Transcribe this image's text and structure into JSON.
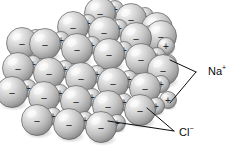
{
  "figure": {
    "background_color": "#ffffff",
    "line_color": "#0d0d0d",
    "sphere_light_color": "#f2f2f2",
    "sphere_mid_color": "#c9c9c9",
    "sphere_dark_color": "#8e8e8e",
    "sphere_outline_color": "#5e5e5e",
    "charge_glyph_color": "#242424"
  },
  "labels": [
    {
      "id": "sodium",
      "text": "Na",
      "superscript": "+",
      "name": "sodium-ion-label",
      "x": 208,
      "y": 72,
      "leaders": [
        {
          "x1": 196,
          "y1": 72,
          "x2": 170,
          "y2": 60
        },
        {
          "x1": 196,
          "y1": 72,
          "x2": 170,
          "y2": 103
        }
      ]
    },
    {
      "id": "chloride",
      "text": "Cl",
      "superscript": "−",
      "name": "chloride-ion-label",
      "x": 179,
      "y": 133,
      "leaders": [
        {
          "x1": 174,
          "y1": 131,
          "x2": 147,
          "y2": 108
        },
        {
          "x1": 174,
          "y1": 131,
          "x2": 108,
          "y2": 121
        }
      ]
    }
  ],
  "legend_meaning": {
    "plus_glyph": "+",
    "minus_glyph": "−",
    "plus_ion": "Na+",
    "minus_ion": "Cl-"
  },
  "lattice": {
    "description": "Isometric cube of alternating large anions and small cations",
    "anion_radius": 15.5,
    "cation_radius": 8.5,
    "spheres": [
      {
        "cx": 100,
        "cy": 13,
        "r": 15.5,
        "q": "−"
      },
      {
        "cx": 131,
        "cy": 19,
        "r": 15.5,
        "q": "−"
      },
      {
        "cx": 157,
        "cy": 28,
        "r": 15.5,
        "q": "−"
      },
      {
        "cx": 115,
        "cy": 9,
        "r": 8.5,
        "q": "+"
      },
      {
        "cx": 145,
        "cy": 16,
        "r": 8.5,
        "q": "+"
      },
      {
        "cx": 73,
        "cy": 27,
        "r": 15.5,
        "q": "−"
      },
      {
        "cx": 104,
        "cy": 32,
        "r": 15.5,
        "q": "−"
      },
      {
        "cx": 136,
        "cy": 38,
        "r": 15.5,
        "q": "−"
      },
      {
        "cx": 88,
        "cy": 23,
        "r": 8.5,
        "q": "+"
      },
      {
        "cx": 119,
        "cy": 28,
        "r": 8.5,
        "q": "+"
      },
      {
        "cx": 151,
        "cy": 34,
        "r": 8.5,
        "q": "+"
      },
      {
        "cx": 45,
        "cy": 44,
        "r": 15.5,
        "q": "−"
      },
      {
        "cx": 77,
        "cy": 49,
        "r": 15.5,
        "q": "−"
      },
      {
        "cx": 109,
        "cy": 54,
        "r": 15.5,
        "q": "−"
      },
      {
        "cx": 141,
        "cy": 59,
        "r": 15.5,
        "q": "−"
      },
      {
        "cx": 61,
        "cy": 40,
        "r": 8.5,
        "q": "+"
      },
      {
        "cx": 92,
        "cy": 45,
        "r": 8.5,
        "q": "+"
      },
      {
        "cx": 124,
        "cy": 50,
        "r": 8.5,
        "q": "+"
      },
      {
        "cx": 157,
        "cy": 56,
        "r": 8.5,
        "q": "+"
      },
      {
        "cx": 22,
        "cy": 43,
        "r": 15.5,
        "q": "−"
      },
      {
        "cx": 36,
        "cy": 38,
        "r": 8.5,
        "q": "+"
      },
      {
        "cx": 18,
        "cy": 68,
        "r": 15.5,
        "q": "−"
      },
      {
        "cx": 49,
        "cy": 73,
        "r": 15.5,
        "q": "−"
      },
      {
        "cx": 81,
        "cy": 78,
        "r": 15.5,
        "q": "−"
      },
      {
        "cx": 113,
        "cy": 83,
        "r": 15.5,
        "q": "−"
      },
      {
        "cx": 145,
        "cy": 88,
        "r": 15.5,
        "q": "−"
      },
      {
        "cx": 33,
        "cy": 64,
        "r": 8.5,
        "q": "+"
      },
      {
        "cx": 65,
        "cy": 69,
        "r": 8.5,
        "q": "+"
      },
      {
        "cx": 97,
        "cy": 74,
        "r": 8.5,
        "q": "+"
      },
      {
        "cx": 129,
        "cy": 79,
        "r": 8.5,
        "q": "+"
      },
      {
        "cx": 161,
        "cy": 84,
        "r": 8.5,
        "q": "+"
      },
      {
        "cx": 12,
        "cy": 92,
        "r": 15.5,
        "q": "−"
      },
      {
        "cx": 44,
        "cy": 97,
        "r": 15.5,
        "q": "−"
      },
      {
        "cx": 76,
        "cy": 101,
        "r": 15.5,
        "q": "−"
      },
      {
        "cx": 108,
        "cy": 106,
        "r": 15.5,
        "q": "−"
      },
      {
        "cx": 140,
        "cy": 110,
        "r": 15.5,
        "q": "−"
      },
      {
        "cx": 28,
        "cy": 88,
        "r": 8.5,
        "q": "+"
      },
      {
        "cx": 60,
        "cy": 93,
        "r": 8.5,
        "q": "+"
      },
      {
        "cx": 92,
        "cy": 97,
        "r": 8.5,
        "q": "+"
      },
      {
        "cx": 124,
        "cy": 102,
        "r": 8.5,
        "q": "+"
      },
      {
        "cx": 156,
        "cy": 106,
        "r": 8.5,
        "q": "+"
      },
      {
        "cx": 37,
        "cy": 120,
        "r": 15.5,
        "q": "−"
      },
      {
        "cx": 69,
        "cy": 124,
        "r": 15.5,
        "q": "−"
      },
      {
        "cx": 101,
        "cy": 127,
        "r": 15.5,
        "q": "−"
      },
      {
        "cx": 53,
        "cy": 116,
        "r": 8.5,
        "q": "+"
      },
      {
        "cx": 85,
        "cy": 120,
        "r": 8.5,
        "q": "+"
      },
      {
        "cx": 117,
        "cy": 123,
        "r": 8.5,
        "q": "+"
      },
      {
        "cx": 166,
        "cy": 46,
        "r": 8.5,
        "q": "+"
      },
      {
        "cx": 168,
        "cy": 63,
        "r": 8.5,
        "q": "+"
      },
      {
        "cx": 168,
        "cy": 100,
        "r": 8.5,
        "q": "+"
      },
      {
        "cx": 163,
        "cy": 70,
        "r": 15.5,
        "q": "−"
      },
      {
        "cx": 161,
        "cy": 36,
        "r": 15.5,
        "q": "−"
      }
    ]
  }
}
